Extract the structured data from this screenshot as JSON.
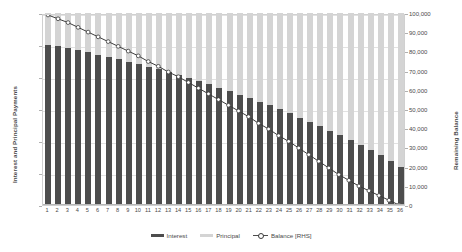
{
  "chart_data": {
    "type": "bar",
    "title": "",
    "subtitle": "",
    "xlabel": "",
    "ylabel": "Interest and Principal Payments",
    "y2label": "Remaining Balance",
    "grid": true,
    "legend_position": "bottom",
    "ylim": [
      0,
      6000
    ],
    "y2lim": [
      0,
      100000
    ],
    "ytick_labels": [
      "6,000",
      "5,000",
      "4,000",
      "3,000",
      "2,000",
      "1,000",
      "0"
    ],
    "ytick_values": [
      6000,
      5000,
      4000,
      3000,
      2000,
      1000,
      0
    ],
    "y2tick_labels": [
      "100,000",
      "90,000",
      "80,000",
      "70,000",
      "60,000",
      "50,000",
      "40,000",
      "30,000",
      "20,000",
      "10,000",
      "0"
    ],
    "y2tick_values": [
      100000,
      90000,
      80000,
      70000,
      60000,
      50000,
      40000,
      30000,
      20000,
      10000,
      0
    ],
    "categories": [
      "1",
      "2",
      "3",
      "4",
      "5",
      "6",
      "7",
      "8",
      "9",
      "10",
      "11",
      "12",
      "13",
      "14",
      "15",
      "16",
      "17",
      "18",
      "19",
      "20",
      "21",
      "22",
      "23",
      "24",
      "25",
      "26",
      "27",
      "28",
      "29",
      "30",
      "31",
      "32",
      "33",
      "34",
      "35",
      "36"
    ],
    "stacked": true,
    "series": [
      {
        "name": "Interest",
        "axis": "left",
        "color": "#4d4d4d",
        "style": "bar",
        "values": [
          5000,
          4960,
          4900,
          4840,
          4780,
          4700,
          4640,
          4560,
          4480,
          4400,
          4320,
          4240,
          4150,
          4060,
          3960,
          3870,
          3770,
          3670,
          3560,
          3450,
          3340,
          3230,
          3110,
          2990,
          2860,
          2730,
          2600,
          2460,
          2320,
          2180,
          2030,
          1870,
          1710,
          1550,
          1380,
          1200
        ]
      },
      {
        "name": "Principal",
        "axis": "left",
        "color": "#d4d4d4",
        "style": "bar",
        "values": [
          1000,
          1040,
          1100,
          1160,
          1220,
          1300,
          1360,
          1440,
          1520,
          1600,
          1680,
          1760,
          1850,
          1940,
          2040,
          2130,
          2230,
          2330,
          2440,
          2550,
          2660,
          2770,
          2890,
          3010,
          3140,
          3270,
          3400,
          3540,
          3680,
          3820,
          3970,
          4130,
          4290,
          4450,
          4620,
          4800
        ]
      },
      {
        "name": "Balance [RHS]",
        "axis": "right",
        "color": "#3a3a3a",
        "style": "line-marker",
        "values": [
          100000,
          98000,
          96000,
          93500,
          91000,
          88500,
          86000,
          83500,
          81000,
          78500,
          75500,
          73000,
          70000,
          67500,
          64500,
          61500,
          58500,
          55500,
          52500,
          49500,
          46500,
          43000,
          40000,
          36500,
          33500,
          30000,
          26500,
          23000,
          19500,
          16000,
          13000,
          10000,
          7500,
          5000,
          2500,
          0
        ]
      }
    ],
    "legend": [
      {
        "label": "Interest",
        "swatch": "bar-dark"
      },
      {
        "label": "Principal",
        "swatch": "bar-light"
      },
      {
        "label": "Balance [RHS]",
        "swatch": "line-marker"
      }
    ]
  }
}
